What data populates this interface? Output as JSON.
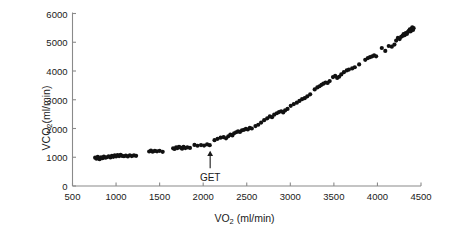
{
  "figure": {
    "background_color": "#ffffff",
    "axis_color": "#8a8a8a",
    "marker_color": "#111111",
    "annotation_color": "#1a1a1a"
  },
  "axis_titles": {
    "y_prefix": "VCO",
    "y_sub": "2",
    "y_suffix": "(ml/min)",
    "x_prefix": "VO",
    "x_sub": "2",
    "x_suffix": " (ml/min)"
  },
  "chart_data": {
    "type": "scatter",
    "title": "",
    "xlabel": "VO2 (ml/min)",
    "ylabel": "VCO2(ml/min)",
    "xlim": [
      500,
      4500
    ],
    "ylim": [
      0,
      6000
    ],
    "grid": false,
    "legend": null,
    "xticks": [
      500,
      1000,
      1500,
      2000,
      2500,
      3000,
      3500,
      4000,
      4500
    ],
    "yticks": [
      0,
      1000,
      2000,
      3000,
      4000,
      5000,
      6000
    ],
    "xtick_labels": [
      "500",
      "1000",
      "1500",
      "2000",
      "2500",
      "3000",
      "3500",
      "4000",
      "4500"
    ],
    "ytick_labels": [
      "0",
      "1000",
      "2000",
      "3000",
      "4000",
      "5000",
      "6000"
    ],
    "marker_size": 3.1,
    "annotations": [
      {
        "text": "GET",
        "x": 2080,
        "y": 1290,
        "arrow_from_y": 620,
        "arrow_to_y": 1230,
        "label_y": 470
      }
    ],
    "points": [
      [
        760,
        985
      ],
      [
        775,
        950
      ],
      [
        790,
        1010
      ],
      [
        800,
        960
      ],
      [
        812,
        930
      ],
      [
        828,
        1000
      ],
      [
        845,
        965
      ],
      [
        860,
        1025
      ],
      [
        878,
        985
      ],
      [
        895,
        1000
      ],
      [
        915,
        1035
      ],
      [
        935,
        995
      ],
      [
        952,
        1050
      ],
      [
        968,
        1015
      ],
      [
        985,
        1065
      ],
      [
        1000,
        1030
      ],
      [
        1018,
        1075
      ],
      [
        1035,
        1040
      ],
      [
        1052,
        1080
      ],
      [
        1070,
        1045
      ],
      [
        1090,
        1035
      ],
      [
        1112,
        1060
      ],
      [
        1135,
        1030
      ],
      [
        1158,
        1070
      ],
      [
        1180,
        1040
      ],
      [
        1205,
        1065
      ],
      [
        1230,
        1050
      ],
      [
        1380,
        1200
      ],
      [
        1400,
        1230
      ],
      [
        1420,
        1195
      ],
      [
        1445,
        1220
      ],
      [
        1470,
        1205
      ],
      [
        1500,
        1225
      ],
      [
        1535,
        1190
      ],
      [
        1655,
        1310
      ],
      [
        1672,
        1290
      ],
      [
        1690,
        1345
      ],
      [
        1705,
        1320
      ],
      [
        1722,
        1365
      ],
      [
        1740,
        1335
      ],
      [
        1758,
        1300
      ],
      [
        1775,
        1360
      ],
      [
        1795,
        1320
      ],
      [
        1818,
        1345
      ],
      [
        1848,
        1325
      ],
      [
        1900,
        1430
      ],
      [
        1935,
        1400
      ],
      [
        1975,
        1425
      ],
      [
        2010,
        1405
      ],
      [
        2045,
        1445
      ],
      [
        2075,
        1420
      ],
      [
        2130,
        1595
      ],
      [
        2165,
        1640
      ],
      [
        2200,
        1680
      ],
      [
        2235,
        1700
      ],
      [
        2262,
        1660
      ],
      [
        2288,
        1730
      ],
      [
        2312,
        1790
      ],
      [
        2335,
        1760
      ],
      [
        2355,
        1835
      ],
      [
        2378,
        1870
      ],
      [
        2400,
        1900
      ],
      [
        2422,
        1880
      ],
      [
        2445,
        1935
      ],
      [
        2468,
        1955
      ],
      [
        2490,
        1990
      ],
      [
        2512,
        1965
      ],
      [
        2535,
        2020
      ],
      [
        2558,
        2000
      ],
      [
        2600,
        2085
      ],
      [
        2632,
        2130
      ],
      [
        2665,
        2205
      ],
      [
        2700,
        2290
      ],
      [
        2735,
        2355
      ],
      [
        2765,
        2420
      ],
      [
        2790,
        2395
      ],
      [
        2815,
        2480
      ],
      [
        2845,
        2530
      ],
      [
        2870,
        2570
      ],
      [
        2895,
        2600
      ],
      [
        2918,
        2560
      ],
      [
        2940,
        2630
      ],
      [
        2968,
        2680
      ],
      [
        3005,
        2790
      ],
      [
        3040,
        2850
      ],
      [
        3075,
        2900
      ],
      [
        3105,
        2960
      ],
      [
        3135,
        3020
      ],
      [
        3165,
        3055
      ],
      [
        3195,
        3120
      ],
      [
        3228,
        3190
      ],
      [
        3280,
        3360
      ],
      [
        3310,
        3430
      ],
      [
        3335,
        3470
      ],
      [
        3358,
        3520
      ],
      [
        3380,
        3560
      ],
      [
        3405,
        3600
      ],
      [
        3428,
        3585
      ],
      [
        3452,
        3650
      ],
      [
        3490,
        3790
      ],
      [
        3515,
        3830
      ],
      [
        3538,
        3760
      ],
      [
        3560,
        3800
      ],
      [
        3585,
        3880
      ],
      [
        3615,
        3960
      ],
      [
        3648,
        4020
      ],
      [
        3672,
        4050
      ],
      [
        3710,
        4090
      ],
      [
        3740,
        4130
      ],
      [
        3790,
        4230
      ],
      [
        3860,
        4390
      ],
      [
        3890,
        4450
      ],
      [
        3915,
        4480
      ],
      [
        3940,
        4510
      ],
      [
        3962,
        4540
      ],
      [
        3985,
        4510
      ],
      [
        4050,
        4800
      ],
      [
        4090,
        4700
      ],
      [
        4130,
        4870
      ],
      [
        4165,
        4845
      ],
      [
        4195,
        4920
      ],
      [
        4215,
        5060
      ],
      [
        4235,
        5150
      ],
      [
        4255,
        5110
      ],
      [
        4272,
        5190
      ],
      [
        4288,
        5220
      ],
      [
        4300,
        5280
      ],
      [
        4312,
        5245
      ],
      [
        4325,
        5320
      ],
      [
        4338,
        5290
      ],
      [
        4350,
        5360
      ],
      [
        4362,
        5400
      ],
      [
        4372,
        5450
      ],
      [
        4382,
        5380
      ],
      [
        4392,
        5470
      ],
      [
        4400,
        5520
      ],
      [
        4408,
        5430
      ],
      [
        4415,
        5490
      ]
    ]
  }
}
